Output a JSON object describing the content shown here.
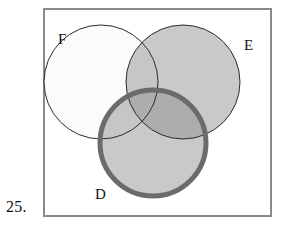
{
  "figure": {
    "item_number": "25.",
    "frame": {
      "x": 44,
      "y": 9,
      "width": 227,
      "height": 207,
      "border_color": "#8a8a8a",
      "fill_color": "#ffffff"
    },
    "type": "venn-diagram",
    "sets": [
      {
        "id": "F",
        "label": "F",
        "cx": 101,
        "cy": 82,
        "r": 57,
        "fill": "#fbfbfb",
        "stroke": "#2b2b2b",
        "stroke_width": 1,
        "label_x": 58,
        "label_y": 44,
        "highlighted": false
      },
      {
        "id": "E",
        "label": "E",
        "cx": 183,
        "cy": 82,
        "r": 57,
        "fill": "#c9c9c9",
        "stroke": "#2b2b2b",
        "stroke_width": 1,
        "label_x": 244,
        "label_y": 50,
        "highlighted": false
      },
      {
        "id": "D",
        "label": "D",
        "cx": 153,
        "cy": 143,
        "r": 53,
        "fill": "#c9c9c9",
        "stroke": "#6b6b6b",
        "stroke_width": 5,
        "label_x": 95,
        "label_y": 199,
        "highlighted": true
      }
    ],
    "shaded_regions": [
      {
        "name": "E-only",
        "shade": "#c9c9c9"
      },
      {
        "name": "D-only",
        "shade": "#c9c9c9"
      },
      {
        "name": "F-only",
        "shade": "#fbfbfb"
      },
      {
        "name": "E-and-F",
        "shade": "#c6c6c6"
      },
      {
        "name": "D-and-E",
        "shade": "#adadad"
      },
      {
        "name": "D-and-F",
        "shade": "#c6c6c6"
      },
      {
        "name": "D-and-E-and-F",
        "shade": "#adadad"
      }
    ],
    "colors": {
      "frame_border": "#8a8a8a",
      "thin_outline": "#2b2b2b",
      "thick_outline": "#6b6b6b",
      "light_fill": "#c9c9c9",
      "pale_fill": "#fbfbfb",
      "dark_fill": "#adadad",
      "page_background": "#ffffff",
      "text": "#121212"
    }
  }
}
